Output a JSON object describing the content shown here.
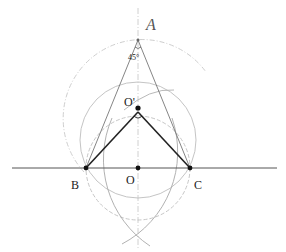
{
  "diagram": {
    "points": {
      "A": {
        "label": "A",
        "x": 138,
        "y": 40
      },
      "O_prime": {
        "label": "O'",
        "x": 138,
        "y": 108
      },
      "B": {
        "label": "B",
        "x": 86,
        "y": 168
      },
      "O": {
        "label": "O",
        "x": 138,
        "y": 168
      },
      "C": {
        "label": "C",
        "x": 190,
        "y": 168
      }
    },
    "angle_label": "45°",
    "colors": {
      "ink": "#1a1a1a",
      "construction": "#b5b5b5",
      "line": "#555555"
    }
  }
}
